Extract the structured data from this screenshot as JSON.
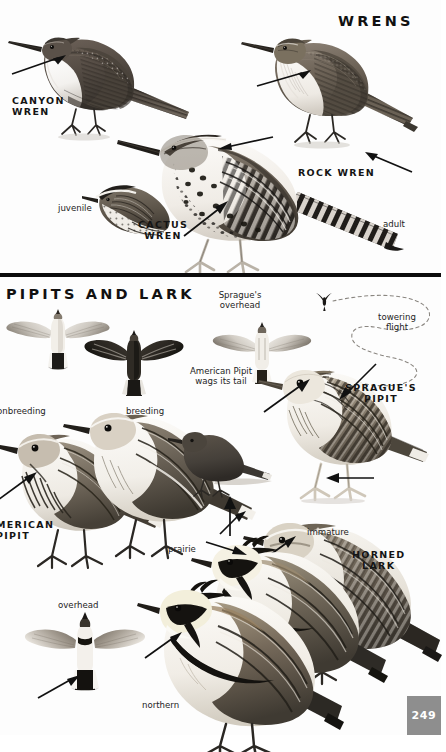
{
  "page": {
    "folio": "249",
    "folio_color": "#8e8e8e",
    "background": "#fdfdfd",
    "ink": "#141414"
  },
  "sections": [
    {
      "id": "wrens",
      "title": "WRENS"
    },
    {
      "id": "pipits-lark",
      "title": "PIPITS AND LARK"
    }
  ],
  "species": [
    {
      "id": "canyon-wren",
      "name_line1": "CANYON",
      "name_line2": "WREN"
    },
    {
      "id": "rock-wren",
      "name_line1": "ROCK WREN",
      "name_line2": ""
    },
    {
      "id": "cactus-wren",
      "name_line1": "CACTUS",
      "name_line2": "WREN"
    },
    {
      "id": "spragues-pipit",
      "name_line1": "SPRAGUE'S",
      "name_line2": "PIPIT"
    },
    {
      "id": "american-pipit",
      "name_line1": "MERICAN",
      "name_line2": "PIPIT"
    },
    {
      "id": "horned-lark",
      "name_line1": "HORNED",
      "name_line2": "LARK"
    }
  ],
  "annotations": {
    "juvenile": "juvenile",
    "adult": "adult",
    "spragues_overhead_l1": "Sprague's",
    "spragues_overhead_l2": "overhead",
    "towering_l1": "towering",
    "towering_l2": "flight",
    "pipit_behavior_l1": "American Pipit",
    "pipit_behavior_l2": "wags its tail",
    "nonbreeding": "onbreeding",
    "breeding": "breeding",
    "prairie": "prairie",
    "immature": "immature",
    "northern": "northern",
    "overhead": "overhead"
  },
  "icons": {
    "pointer_arrow": "arrow-icon",
    "flight_path": "dashed-flight-path-icon"
  }
}
